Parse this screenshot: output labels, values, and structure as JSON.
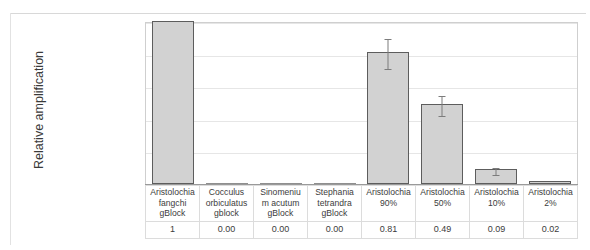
{
  "figure": {
    "y_axis_title": "Relative amplification"
  },
  "chart_data": {
    "type": "bar",
    "title": "",
    "xlabel": "",
    "ylabel": "Relative amplification",
    "ylim": [
      0,
      1
    ],
    "yticks": [
      "0",
      "0.2",
      "0.4",
      "0.6",
      "0.8",
      "1"
    ],
    "ytick_values": [
      0,
      0.2,
      0.4,
      0.6,
      0.8,
      1
    ],
    "grid": true,
    "legend": "none",
    "categories": [
      "Aristolochia fangchi gBlock",
      "Cocculus orbiculatus gblock",
      "Sinomenium acutum gBlock",
      "Stephania tetrandra gBlock",
      "Aristolochia 90%",
      "Aristolochia 50%",
      "Aristolochia 10%",
      "Aristolochia 2%"
    ],
    "category_lines": [
      [
        "Aristolochia",
        "fangchi",
        "gBlock"
      ],
      [
        "Cocculus",
        "orbiculatus",
        "gblock"
      ],
      [
        "Sinomeniu",
        "m acutum",
        "gBlock"
      ],
      [
        "Stephania",
        "tetrandra",
        "gBlock"
      ],
      [
        "Aristolochia",
        "90%"
      ],
      [
        "Aristolochia",
        "50%"
      ],
      [
        "Aristolochia",
        "10%"
      ],
      [
        "Aristolochia",
        "2%"
      ]
    ],
    "values": [
      1,
      0.0,
      0.0,
      0.0,
      0.81,
      0.49,
      0.09,
      0.02
    ],
    "value_labels": [
      "1",
      "0.00",
      "0.00",
      "0.00",
      "0.81",
      "0.49",
      "0.09",
      "0.02"
    ],
    "errors": [
      0,
      0,
      0,
      0,
      0.09,
      0.06,
      0.02,
      0
    ],
    "bar_fill": "#d2d2d2",
    "bar_border": "#5d5d5d",
    "error_color": "#7c7c7c",
    "gridline_color": "#e6e6e6"
  }
}
